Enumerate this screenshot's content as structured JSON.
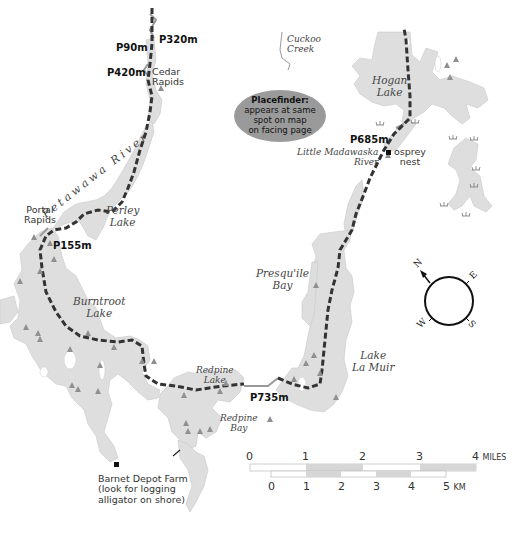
{
  "map": {
    "colors": {
      "water": "#dedede",
      "route": "#333333",
      "portage_line": "#999999",
      "campsite": "#8f8f8f",
      "placefinder_fill": "#9a9a9a",
      "scale_shade": "#d6d6d6"
    },
    "portages": [
      {
        "id": "p90",
        "label": "P90m"
      },
      {
        "id": "p320",
        "label": "P320m"
      },
      {
        "id": "p420",
        "label": "P420m"
      },
      {
        "id": "p155",
        "label": "P155m"
      },
      {
        "id": "p685",
        "label": "P685m"
      },
      {
        "id": "p735",
        "label": "P735m"
      }
    ],
    "places": {
      "cedar_rapids": [
        "Cedar",
        "Rapids"
      ],
      "portal_rapids": [
        "Portal",
        "Rapids"
      ],
      "osprey_nest": [
        "osprey",
        "nest"
      ],
      "barnet_depot": [
        "Barnet Depot Farm",
        "(look for logging",
        "alligator on shore)"
      ]
    },
    "water_bodies": {
      "cuckoo_creek": [
        "Cuckoo",
        "Creek"
      ],
      "hogan_lake": [
        "Hogan",
        "Lake"
      ],
      "little_madawaska": [
        "Little Madawaska",
        "River"
      ],
      "petawawa_river": "Petawawa River",
      "perley_lake": [
        "Perley",
        "Lake"
      ],
      "presquile_bay": [
        "Presqu'ile",
        "Bay"
      ],
      "burntroot_lake": [
        "Burntroot",
        "Lake"
      ],
      "lake_la_muir": [
        "Lake",
        "La Muir"
      ],
      "redpine_lake": [
        "Redpine",
        "Lake"
      ],
      "redpine_bay": [
        "Redpine",
        "Bay"
      ]
    },
    "placefinder": {
      "title": "Placefinder:",
      "lines": [
        "appears at same",
        "spot on map",
        "on facing page"
      ]
    },
    "compass": {
      "icon": "compass-rose-icon",
      "labels": {
        "n": "N",
        "e": "E",
        "s": "S",
        "w": "W"
      }
    },
    "scale_bar": {
      "miles": {
        "ticks": [
          "0",
          "1",
          "2",
          "3",
          "4"
        ],
        "unit": "MILES"
      },
      "km": {
        "ticks": [
          "0",
          "1",
          "2",
          "3",
          "4",
          "5"
        ],
        "unit": "KM"
      }
    },
    "icons": {
      "campsite": "campsite-triangle-icon",
      "marsh": "marsh-icon",
      "landmark": "square-marker-icon",
      "dam": "dam-icon"
    }
  }
}
